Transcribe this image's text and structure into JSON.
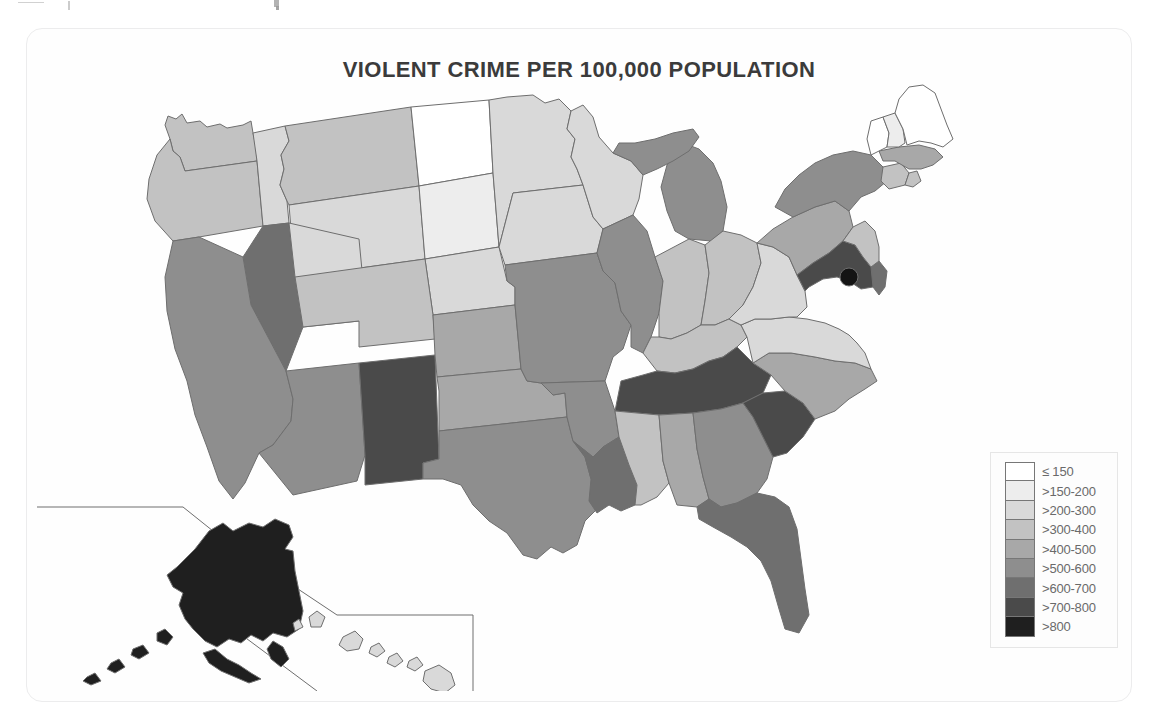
{
  "figure": {
    "title": "VIOLENT CRIME PER 100,000 POPULATION",
    "background": "#fefefe",
    "border_color": "#ececed",
    "outline_color": "#6e6e6e"
  },
  "legend": {
    "title": "",
    "position": "bottom-right",
    "border_color": "#e6e6e6",
    "items": [
      {
        "label": "≤ 150",
        "color": "#ffffff"
      },
      {
        "label": ">150-200",
        "color": "#ededed"
      },
      {
        "label": ">200-300",
        "color": "#d9d9d9"
      },
      {
        "label": ">300-400",
        "color": "#c2c2c2"
      },
      {
        "label": ">400-500",
        "color": "#a8a8a8"
      },
      {
        "label": ">500-600",
        "color": "#8e8e8e"
      },
      {
        "label": ">600-700",
        "color": "#6f6f6f"
      },
      {
        "label": ">700-800",
        "color": "#4a4a4a"
      },
      {
        "label": ">800",
        "color": "#1f1f1f"
      }
    ]
  },
  "chart_data": {
    "type": "heatmap",
    "subtype": "choropleth-map",
    "title": "VIOLENT CRIME PER 100,000 POPULATION",
    "xlabel": "",
    "ylabel": "",
    "unit": "violent crimes per 100,000 population",
    "grid": false,
    "legend_position": "bottom-right",
    "class_breaks": [
      150,
      200,
      300,
      400,
      500,
      600,
      700,
      800
    ],
    "class_labels": [
      "≤ 150",
      ">150-200",
      ">200-300",
      ">300-400",
      ">400-500",
      ">500-600",
      ">600-700",
      ">700-800",
      ">800"
    ],
    "class_colors": [
      "#ffffff",
      "#ededed",
      "#d9d9d9",
      "#c2c2c2",
      "#a8a8a8",
      "#8e8e8e",
      "#6f6f6f",
      "#4a4a4a",
      "#1f1f1f"
    ],
    "categories": [
      "Alabama",
      "Alaska",
      "Arizona",
      "Arkansas",
      "California",
      "Colorado",
      "Connecticut",
      "Delaware",
      "District of Columbia",
      "Florida",
      "Georgia",
      "Hawaii",
      "Idaho",
      "Illinois",
      "Indiana",
      "Iowa",
      "Kansas",
      "Kentucky",
      "Louisiana",
      "Maine",
      "Maryland",
      "Massachusetts",
      "Michigan",
      "Minnesota",
      "Mississippi",
      "Missouri",
      "Montana",
      "Nebraska",
      "Nevada",
      "New Hampshire",
      "New Jersey",
      "New Mexico",
      "New York",
      "North Carolina",
      "North Dakota",
      "Ohio",
      "Oklahoma",
      "Oregon",
      "Pennsylvania",
      "Rhode Island",
      "South Carolina",
      "South Dakota",
      "Tennessee",
      "Texas",
      "Utah",
      "Vermont",
      "Virginia",
      "Washington",
      "West Virginia",
      "Wisconsin",
      "Wyoming"
    ],
    "values": [
      ">400-500",
      ">800",
      ">500-600",
      ">500-600",
      ">500-600",
      ">300-400",
      ">300-400",
      ">600-700",
      ">800",
      ">600-700",
      ">500-600",
      ">200-300",
      ">200-300",
      ">500-600",
      ">300-400",
      ">200-300",
      ">400-500",
      ">300-400",
      ">600-700",
      "≤ 150",
      ">700-800",
      ">400-500",
      ">500-600",
      ">200-300",
      ">300-400",
      ">500-600",
      ">300-400",
      ">200-300",
      ">600-700",
      ">150-200",
      ">300-400",
      ">700-800",
      ">500-600",
      ">400-500",
      "≤ 150",
      ">300-400",
      ">400-500",
      ">300-400",
      ">400-500",
      ">300-400",
      ">700-800",
      ">150-200",
      ">700-800",
      ">500-600",
      ">200-300",
      "≤ 150",
      ">200-300",
      ">300-400",
      ">200-300",
      ">200-300",
      ">200-300"
    ]
  },
  "map": {
    "dc_marker_name": "district-of-columbia-marker",
    "inset_label": ""
  }
}
